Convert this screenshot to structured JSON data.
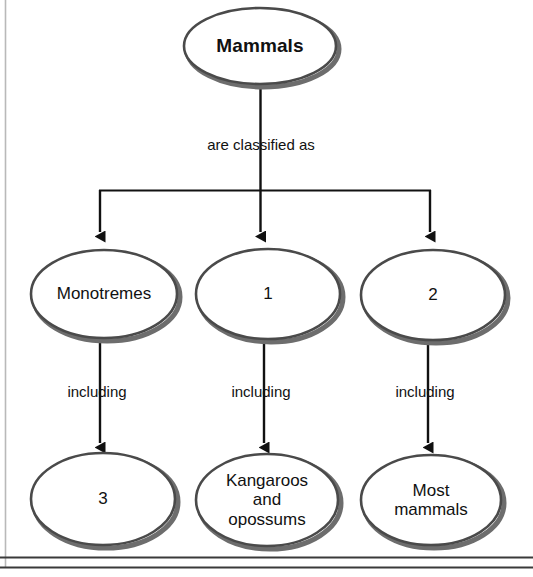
{
  "diagram": {
    "type": "hierarchy-flowchart",
    "colors": {
      "background": "#ffffff",
      "oval_stroke": "#4a4a4a",
      "oval_shadow": "#6d6d6d",
      "oval_fill": "#ffffff",
      "connector": "#111111",
      "text": "#111111",
      "left_rule": "#b9b9b9",
      "bottom_rule": "#3a3a3a"
    },
    "root": {
      "id": "mammals",
      "label": "Mammals",
      "bold": true
    },
    "root_edge_label": "are classified as",
    "branch_edge_labels": [
      "including",
      "including",
      "including"
    ],
    "middle_row": [
      {
        "id": "monotremes",
        "label": "Monotremes",
        "is_blank": false
      },
      {
        "id": "blank-1",
        "label": "1",
        "is_blank": true
      },
      {
        "id": "blank-2",
        "label": "2",
        "is_blank": true
      }
    ],
    "bottom_row": [
      {
        "id": "blank-3",
        "label": "3",
        "is_blank": true
      },
      {
        "id": "kangaroos-opossums",
        "label": "Kangaroos\nand\nopossums",
        "is_blank": false
      },
      {
        "id": "most-mammals",
        "label": "Most\nmammals",
        "is_blank": false
      }
    ]
  }
}
